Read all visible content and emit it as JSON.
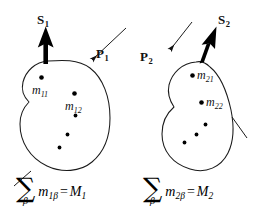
{
  "figure": {
    "title_text": "",
    "background_color": "#ffffff",
    "stroke_color": "#1a1a1a",
    "arrow_fill": "#000000",
    "dot_color": "#000000",
    "panels": [
      {
        "id": "panel-1",
        "body_label": "body-1",
        "spin_vector": {
          "symbol": "S",
          "subscript": "1",
          "style": "bold-upright",
          "direction": "up",
          "thick": true
        },
        "momentum_vector": {
          "symbol": "P",
          "subscript": "1",
          "style": "bold-upright",
          "direction": "down-left",
          "thick": false
        },
        "mass_points": [
          {
            "symbol": "m",
            "subscript": "11",
            "labeled": true
          },
          {
            "symbol": "m",
            "subscript": "12",
            "labeled": true
          },
          {
            "symbol": "m",
            "subscript": "13",
            "labeled": false
          },
          {
            "symbol": "m",
            "subscript": "14",
            "labeled": false
          },
          {
            "symbol": "m",
            "subscript": "15",
            "labeled": false
          }
        ],
        "equation": {
          "sum_symbol": "∑",
          "index": "β",
          "summand_base": "m",
          "summand_sub": "1β",
          "equals": "=",
          "result_base": "M",
          "result_sub": "1",
          "plain": "∑_β m_1β = M_1"
        }
      },
      {
        "id": "panel-2",
        "body_label": "body-2",
        "spin_vector": {
          "symbol": "S",
          "subscript": "2",
          "style": "bold-upright",
          "direction": "up-right",
          "thick": true
        },
        "momentum_vector": {
          "symbol": "P",
          "subscript": "2",
          "style": "bold-upright",
          "direction": "down-left",
          "thick": false
        },
        "mass_points": [
          {
            "symbol": "m",
            "subscript": "21",
            "labeled": true
          },
          {
            "symbol": "m",
            "subscript": "22",
            "labeled": true
          },
          {
            "symbol": "m",
            "subscript": "23",
            "labeled": false
          },
          {
            "symbol": "m",
            "subscript": "24",
            "labeled": false
          },
          {
            "symbol": "m",
            "subscript": "25",
            "labeled": false
          }
        ],
        "equation": {
          "sum_symbol": "∑",
          "index": "β",
          "summand_base": "m",
          "summand_sub": "2β",
          "equals": "=",
          "result_base": "M",
          "result_sub": "2",
          "plain": "∑_β m_2β = M_2"
        }
      }
    ]
  },
  "labels": {
    "s1_base": "S",
    "s1_sub": "1",
    "p1_base": "P",
    "p1_sub": "1",
    "s2_base": "S",
    "s2_sub": "2",
    "p2_base": "P",
    "p2_sub": "2",
    "m11_base": "m",
    "m11_sub": "11",
    "m12_base": "m",
    "m12_sub": "12",
    "m21_base": "m",
    "m21_sub": "21",
    "m22_base": "m",
    "m22_sub": "22"
  },
  "equations": {
    "left": {
      "sigma": "∑",
      "sub": "β",
      "m_base": "m",
      "m_sub": "1β",
      "eq": "=",
      "M_base": "M",
      "M_sub": "1"
    },
    "right": {
      "sigma": "∑",
      "sub": "β",
      "m_base": "m",
      "m_sub": "2β",
      "eq": "=",
      "M_base": "M",
      "M_sub": "2"
    }
  }
}
